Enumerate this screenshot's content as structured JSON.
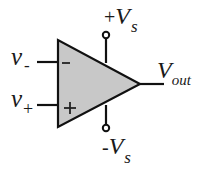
{
  "diagram": {
    "colors": {
      "fill": "#c8c8c8",
      "stroke": "#111111",
      "background": "#ffffff"
    },
    "inputs": {
      "inverting": {
        "label_main": "v",
        "label_sub": "-",
        "symbol": "−"
      },
      "non_inverting": {
        "label_main": "v",
        "label_sub": "+",
        "symbol": "+"
      }
    },
    "output": {
      "label_main": "V",
      "label_sub": "out"
    },
    "supply": {
      "positive": {
        "prefix": "+",
        "label_main": "V",
        "label_sub": "s"
      },
      "negative": {
        "prefix": "-",
        "label_main": "V",
        "label_sub": "s"
      }
    }
  }
}
